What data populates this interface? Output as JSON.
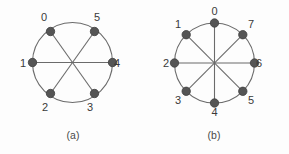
{
  "figure": {
    "background_color": "#fdfdfd",
    "stroke_color": "#6b6b6b",
    "node_fill_color": "#555555",
    "node_stroke_color": "#3f3f3f",
    "label_color": "#3a3a3a",
    "panels": [
      {
        "id": "panel-a",
        "caption": "(a)",
        "caption_x": 73,
        "caption_y": 139,
        "center_x": 72.5,
        "center_y": 62.5,
        "radius": 40,
        "node_radius": 4.2,
        "node_count": 6,
        "nodes": [
          {
            "label": "0",
            "x": 50.5,
            "y": 31.5,
            "label_x": 44,
            "label_y": 21
          },
          {
            "label": "1",
            "x": 32.5,
            "y": 62.5,
            "label_x": 23,
            "label_y": 67
          },
          {
            "label": "2",
            "x": 50.5,
            "y": 93.5,
            "label_x": 45,
            "label_y": 111
          },
          {
            "label": "3",
            "x": 94.5,
            "y": 93.5,
            "label_x": 90,
            "label_y": 111
          },
          {
            "label": "4",
            "x": 112.5,
            "y": 62.5,
            "label_x": 117,
            "label_y": 67
          },
          {
            "label": "5",
            "x": 94.5,
            "y": 31.5,
            "label_x": 97,
            "label_y": 21
          }
        ],
        "chords": [
          {
            "from": "0",
            "to": "3"
          },
          {
            "from": "1",
            "to": "4"
          },
          {
            "from": "2",
            "to": "5"
          }
        ]
      },
      {
        "id": "panel-b",
        "caption": "(b)",
        "caption_x": 214,
        "caption_y": 139,
        "center_x": 214.5,
        "center_y": 63,
        "radius": 40,
        "node_radius": 4.2,
        "node_count": 8,
        "nodes": [
          {
            "label": "0",
            "x": 214.5,
            "y": 23.0,
            "label_x": 214.5,
            "label_y": 15
          },
          {
            "label": "1",
            "x": 186.2,
            "y": 34.7,
            "label_x": 178,
            "label_y": 28
          },
          {
            "label": "2",
            "x": 174.5,
            "y": 63.0,
            "label_x": 166,
            "label_y": 67
          },
          {
            "label": "3",
            "x": 186.2,
            "y": 91.3,
            "label_x": 178,
            "label_y": 104
          },
          {
            "label": "4",
            "x": 214.5,
            "y": 103.0,
            "label_x": 214.5,
            "label_y": 116
          },
          {
            "label": "5",
            "x": 242.8,
            "y": 91.3,
            "label_x": 251,
            "label_y": 104
          },
          {
            "label": "6",
            "x": 254.5,
            "y": 63.0,
            "label_x": 259,
            "label_y": 67
          },
          {
            "label": "7",
            "x": 242.8,
            "y": 34.7,
            "label_x": 251,
            "label_y": 28
          }
        ],
        "chords": [
          {
            "from": "0",
            "to": "4"
          },
          {
            "from": "1",
            "to": "5"
          },
          {
            "from": "2",
            "to": "6"
          },
          {
            "from": "3",
            "to": "7"
          }
        ]
      }
    ]
  }
}
